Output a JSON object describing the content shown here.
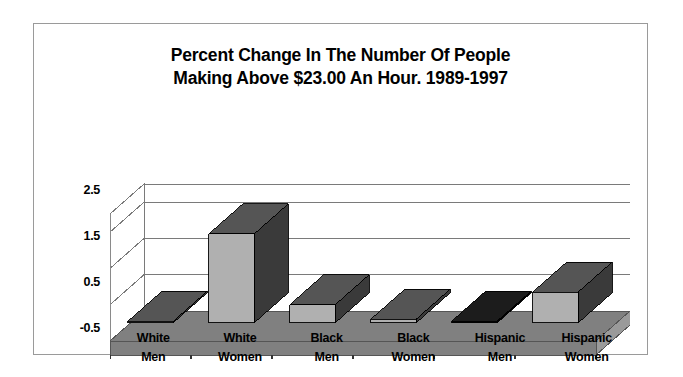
{
  "chart_data": {
    "type": "bar",
    "title": "Percent Change In The Number Of People Making Above $23.00 An Hour. 1989-1997",
    "title_lines": [
      "Percent Change In The Number Of People",
      "Making Above $23.00 An Hour. 1989-1997"
    ],
    "xlabel": "",
    "ylabel": "",
    "ylim": [
      -0.5,
      3.0
    ],
    "yticks": [
      2.5,
      1.5,
      0.5,
      -0.5
    ],
    "ytick_labels": [
      "2.5",
      "1.5",
      "0.5",
      "-0.5"
    ],
    "grid": true,
    "legend": "none",
    "three_d": true,
    "categories": [
      "White Men",
      "White Women",
      "Black Men",
      "Black Women",
      "Hispanic Men",
      "Hispanic Women"
    ],
    "category_lines": [
      [
        "White",
        "Men"
      ],
      [
        "White",
        "Women"
      ],
      [
        "Black",
        "Men"
      ],
      [
        "Black",
        "Women"
      ],
      [
        "Hispanic",
        "Men"
      ],
      [
        "Hispanic",
        "Women"
      ]
    ],
    "values": [
      0.0,
      2.45,
      0.5,
      0.1,
      0.05,
      0.85
    ],
    "bar_colors": [
      "#b0b0b0",
      "#b0b0b0",
      "#b0b0b0",
      "#b0b0b0",
      "#111111",
      "#b0b0b0"
    ],
    "series": [
      {
        "name": "Percent Change",
        "values": [
          0.0,
          2.45,
          0.5,
          0.1,
          0.05,
          0.85
        ]
      }
    ]
  },
  "colors": {
    "bar_front": "#b0b0b0",
    "bar_side": "#3a3a3a",
    "bar_top": "#555555",
    "bar_front_dark": "#111111",
    "bar_side_dark": "#000000",
    "bar_top_dark": "#1c1c1c",
    "floor": "#808080",
    "floor_edge": "#555555",
    "wall_line": "#7a7a7a",
    "frame_border": "#9a9a9a",
    "text": "#000000",
    "background": "#ffffff"
  }
}
